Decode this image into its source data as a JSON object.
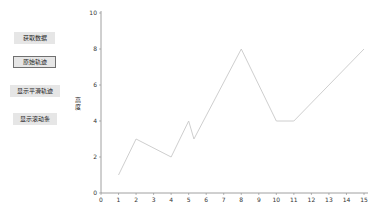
{
  "buttons": [
    {
      "label": "获取数据",
      "selected": false
    },
    {
      "label": "原始轨迹",
      "selected": true
    },
    {
      "label": "显示平滑轨迹",
      "selected": false
    },
    {
      "label": "显示滚动条",
      "selected": false
    }
  ],
  "chart_data": {
    "type": "line",
    "title": "",
    "xlabel": "",
    "ylabel": "高度",
    "xlim": [
      0,
      15
    ],
    "ylim": [
      0,
      10
    ],
    "x_ticks": [
      0,
      1,
      2,
      3,
      4,
      5,
      6,
      7,
      8,
      9,
      10,
      11,
      12,
      13,
      14,
      15
    ],
    "y_ticks": [
      0,
      2,
      4,
      6,
      8,
      10
    ],
    "grid": false,
    "series": [
      {
        "name": "原始轨迹",
        "color": "#c8c8c8",
        "x": [
          1,
          2,
          4,
          5,
          5.3,
          8,
          10,
          11,
          15
        ],
        "y": [
          1,
          3,
          2,
          4,
          3,
          8,
          4,
          4,
          8
        ]
      }
    ]
  }
}
